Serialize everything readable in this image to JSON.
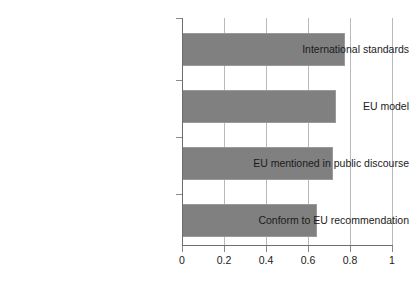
{
  "chart_data": {
    "type": "bar",
    "orientation": "horizontal",
    "title": "",
    "subtitle": "",
    "xlabel": "",
    "ylabel": "",
    "categories": [
      "International standards",
      "EU model",
      "EU mentioned in public discourse",
      "Conform to EU recommendation"
    ],
    "values": [
      0.775,
      0.735,
      0.72,
      0.645
    ],
    "xlim": [
      0,
      1
    ],
    "xticks": [
      0,
      0.2,
      0.4,
      0.6,
      0.8,
      1
    ],
    "xtick_labels": [
      "0",
      "0.2",
      "0.4",
      "0.6",
      "0.8",
      "1"
    ],
    "grid": true,
    "grid_axis": "x",
    "legend": false,
    "legend_position": "none",
    "bar_color": "#808080",
    "grid_color": "#b9b9b9",
    "axis_color": "#6d6d6d",
    "background": "#ffffff"
  }
}
